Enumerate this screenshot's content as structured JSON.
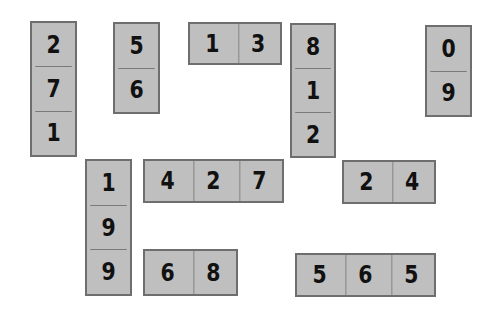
{
  "board": {
    "background": "#ffffff",
    "tile_fill": "#bfbfbf",
    "tile_border": "#6e6e6e",
    "digit_color": "#111111"
  },
  "tiles": [
    {
      "id": "a",
      "orientation": "vertical",
      "x": 30,
      "y": 21,
      "w": 47,
      "h": 136,
      "digits": [
        "2",
        "7",
        "1"
      ]
    },
    {
      "id": "b",
      "orientation": "vertical",
      "x": 113,
      "y": 22,
      "w": 47,
      "h": 92,
      "digits": [
        "5",
        "6"
      ]
    },
    {
      "id": "c",
      "orientation": "horizontal",
      "x": 188,
      "y": 22,
      "w": 94,
      "h": 43,
      "digits": [
        "1",
        "3"
      ]
    },
    {
      "id": "d",
      "orientation": "vertical",
      "x": 290,
      "y": 23,
      "w": 46,
      "h": 135,
      "digits": [
        "8",
        "1",
        "2"
      ]
    },
    {
      "id": "e",
      "orientation": "vertical",
      "x": 425,
      "y": 25,
      "w": 47,
      "h": 92,
      "digits": [
        "0",
        "9"
      ]
    },
    {
      "id": "f",
      "orientation": "vertical",
      "x": 85,
      "y": 159,
      "w": 47,
      "h": 137,
      "digits": [
        "1",
        "9",
        "9"
      ]
    },
    {
      "id": "g",
      "orientation": "horizontal",
      "x": 143,
      "y": 159,
      "w": 141,
      "h": 44,
      "digits": [
        "4",
        "2",
        "7"
      ]
    },
    {
      "id": "h",
      "orientation": "horizontal",
      "x": 342,
      "y": 160,
      "w": 94,
      "h": 44,
      "digits": [
        "2",
        "4"
      ]
    },
    {
      "id": "i",
      "orientation": "horizontal",
      "x": 143,
      "y": 249,
      "w": 95,
      "h": 47,
      "digits": [
        "6",
        "8"
      ]
    },
    {
      "id": "j",
      "orientation": "horizontal",
      "x": 295,
      "y": 253,
      "w": 141,
      "h": 44,
      "digits": [
        "5",
        "6",
        "5"
      ]
    }
  ]
}
